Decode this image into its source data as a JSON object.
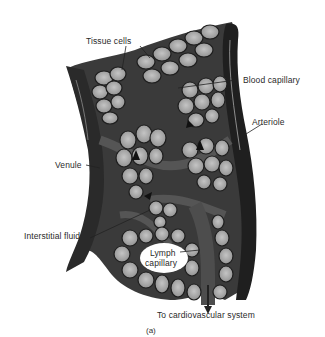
{
  "figure": {
    "type": "anatomical illustration",
    "style": "grayscale drawing",
    "caption": "(a)",
    "colors": {
      "background": "#ffffff",
      "vessel_dark": "#2b2b2b",
      "vessel_mid": "#4a4a4a",
      "interstitial": "#5c5c5c",
      "cell_fill": "#a9a9a9",
      "cell_outline": "#1e1e1e",
      "nucleus": "#3a3a3a",
      "label_text": "#2a2a2a"
    }
  },
  "labels": {
    "tissue_cells": "Tissue cells",
    "blood_capillary": "Blood capillary",
    "arteriole": "Arteriole",
    "venule": "Venule",
    "interstitial_fluid": "Interstitial fluid",
    "lymph_capillary_line1": "Lymph",
    "lymph_capillary_line2": "capillary",
    "to_cardiovascular": "To cardiovascular system"
  }
}
